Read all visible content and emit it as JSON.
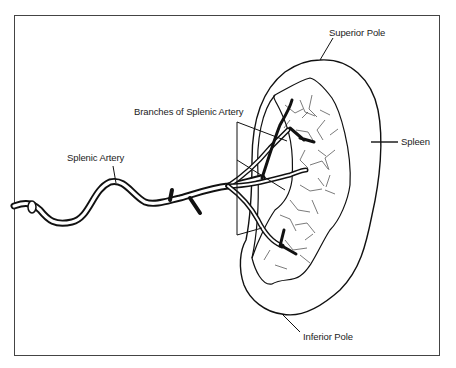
{
  "diagram": {
    "labels": {
      "superior_pole": "Superior Pole",
      "spleen": "Spleen",
      "branches": "Branches of Splenic Artery",
      "splenic_artery": "Splenic Artery",
      "inferior_pole": "Inferior Pole"
    },
    "colors": {
      "ink": "#111111",
      "frame": "#444444",
      "background": "#ffffff"
    }
  }
}
